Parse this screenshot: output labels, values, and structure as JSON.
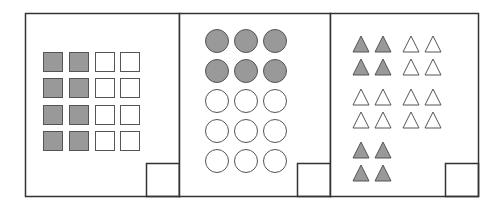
{
  "figure": {
    "colors": {
      "stroke": "#333333",
      "shape_stroke": "#555555",
      "shaded_fill": "#999999",
      "unshaded_fill": "#ffffff",
      "background": "#ffffff"
    },
    "panels": [
      {
        "name": "panel-squares",
        "shape": "square",
        "rows": 4,
        "cols": 4,
        "shaded_per_row": 2,
        "shaded_count": 8,
        "total_count": 16
      },
      {
        "name": "panel-circles",
        "shape": "circle",
        "rows": 5,
        "cols": 3,
        "shaded_rows": 2,
        "shaded_count": 6,
        "total_count": 15
      },
      {
        "name": "panel-triangles",
        "shape": "triangle",
        "groups": [
          {
            "row_group": 1,
            "col_group": 1,
            "shaded": true,
            "count": 4
          },
          {
            "row_group": 1,
            "col_group": 2,
            "shaded": false,
            "count": 4
          },
          {
            "row_group": 2,
            "col_group": 1,
            "shaded": false,
            "count": 4
          },
          {
            "row_group": 2,
            "col_group": 2,
            "shaded": false,
            "count": 4
          },
          {
            "row_group": 3,
            "col_group": 1,
            "shaded": true,
            "count": 4
          }
        ],
        "shaded_count": 8,
        "total_count": 20
      }
    ]
  }
}
